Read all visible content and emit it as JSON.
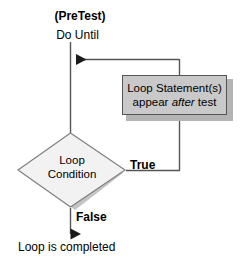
{
  "diagram": {
    "title_text": "(PreTest)",
    "entry_label": "Do Until",
    "process": {
      "line1": "Loop Statement(s)",
      "line2_pre": "appear ",
      "line2_em": "after",
      "line2_post": " test"
    },
    "decision": {
      "line1": "Loop",
      "line2": "Condition"
    },
    "branch_true_label": "True",
    "branch_false_label": "False",
    "exit_label": "Loop is completed",
    "colors": {
      "process_fill": "#c9c9c9",
      "process_border": "#555555",
      "process_shadow": "#b4b4b4",
      "decision_fill": "#f2f2f2",
      "decision_border": "#808080",
      "decision_shadow": "#c4c4c4",
      "line": "#555555",
      "text": "#000000",
      "background": "#ffffff"
    }
  }
}
